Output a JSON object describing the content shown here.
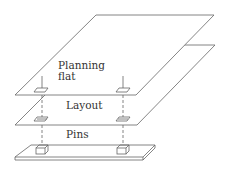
{
  "diagram": {
    "layers": [
      {
        "id": "planning-flat",
        "label_line1": "Planning",
        "label_line2": "flat"
      },
      {
        "id": "layout",
        "label": "Layout"
      },
      {
        "id": "pins",
        "label": "Pins"
      }
    ],
    "colors": {
      "stroke": "#555555",
      "text": "#333333",
      "background": "#ffffff"
    }
  }
}
